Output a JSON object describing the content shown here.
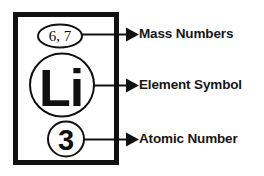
{
  "diagram": {
    "element_box": {
      "name": "element-box",
      "mass_numbers": "6, 7",
      "element_symbol": "Li",
      "atomic_number": "3"
    },
    "callouts": [
      {
        "id": "mass-numbers",
        "label": "Mass Numbers",
        "arrow": "right-arrow"
      },
      {
        "id": "element-symbol",
        "label": "Element Symbol",
        "arrow": "right-arrow"
      },
      {
        "id": "atomic-number",
        "label": "Atomic Number",
        "arrow": "right-arrow"
      }
    ],
    "colors": {
      "background": "#ffffff",
      "ink": "#111111",
      "text": "#161616"
    }
  }
}
